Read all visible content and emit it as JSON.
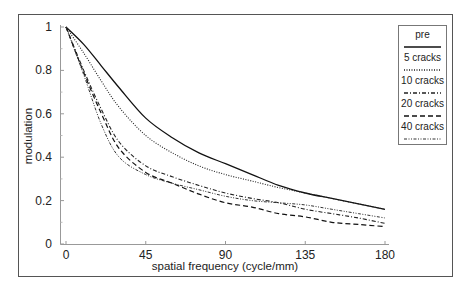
{
  "chart_data": {
    "type": "line",
    "title": "",
    "xlabel": "spatial frequency (cycle/mm)",
    "ylabel": "modulation",
    "xlim": [
      0,
      180
    ],
    "ylim": [
      0,
      1
    ],
    "xticks": [
      0,
      45,
      90,
      135,
      180
    ],
    "xtick_labels": [
      "0",
      "45",
      "90",
      "135",
      "180"
    ],
    "yticks": [
      0,
      0.2,
      0.4,
      0.6,
      0.8,
      1
    ],
    "ytick_labels": [
      "0",
      "0.2",
      "0.4",
      "0.6",
      "0.8",
      "1"
    ],
    "grid": false,
    "legend_position": "top-right",
    "series": [
      {
        "name": "pre",
        "style": "solid",
        "x": [
          0,
          10,
          20,
          30,
          45,
          60,
          75,
          90,
          105,
          120,
          135,
          150,
          165,
          180
        ],
        "y": [
          1.0,
          0.92,
          0.82,
          0.72,
          0.58,
          0.49,
          0.42,
          0.37,
          0.32,
          0.27,
          0.235,
          0.21,
          0.185,
          0.16
        ]
      },
      {
        "name": "5 cracks",
        "style": "dotted",
        "x": [
          0,
          10,
          20,
          30,
          45,
          60,
          75,
          90,
          105,
          120,
          135,
          150,
          165,
          180
        ],
        "y": [
          1.0,
          0.88,
          0.75,
          0.63,
          0.5,
          0.42,
          0.36,
          0.32,
          0.29,
          0.26,
          0.235,
          0.21,
          0.185,
          0.16
        ]
      },
      {
        "name": "10 cracks",
        "style": "dash-dot",
        "x": [
          0,
          10,
          20,
          30,
          45,
          60,
          75,
          90,
          105,
          120,
          135,
          150,
          165,
          180
        ],
        "y": [
          1.0,
          0.8,
          0.62,
          0.47,
          0.36,
          0.31,
          0.27,
          0.235,
          0.21,
          0.19,
          0.16,
          0.14,
          0.12,
          0.095
        ]
      },
      {
        "name": "20 cracks",
        "style": "dashed",
        "x": [
          0,
          10,
          20,
          30,
          45,
          60,
          75,
          90,
          105,
          120,
          135,
          150,
          165,
          180
        ],
        "y": [
          1.0,
          0.79,
          0.6,
          0.44,
          0.33,
          0.28,
          0.23,
          0.19,
          0.17,
          0.14,
          0.125,
          0.1,
          0.09,
          0.08
        ]
      },
      {
        "name": "40 cracks",
        "style": "dash-dot-dot",
        "x": [
          0,
          10,
          20,
          30,
          45,
          60,
          75,
          90,
          105,
          120,
          135,
          150,
          165,
          180
        ],
        "y": [
          1.0,
          0.78,
          0.55,
          0.4,
          0.32,
          0.28,
          0.25,
          0.22,
          0.2,
          0.19,
          0.18,
          0.16,
          0.14,
          0.12
        ]
      }
    ]
  }
}
